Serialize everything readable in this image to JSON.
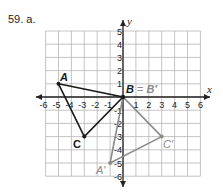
{
  "problem": {
    "label": "59. a."
  },
  "plot": {
    "x_axis_label": "x",
    "y_axis_label": "y",
    "x_ticks": [
      "-6",
      "-5",
      "-4",
      "-3",
      "-2",
      "-1",
      "1",
      "2",
      "3",
      "4",
      "5",
      "6"
    ],
    "y_ticks": [
      "5",
      "4",
      "3",
      "2",
      "1",
      "-1",
      "-2",
      "-3",
      "-4",
      "-5",
      "-6"
    ],
    "xlim": [
      -6,
      6
    ],
    "ylim": [
      -6,
      5
    ]
  },
  "original_triangle": {
    "color": "#1a1a1a",
    "vertices": [
      {
        "name": "A",
        "x": -5,
        "y": 1
      },
      {
        "name": "B",
        "x": 0,
        "y": 0
      },
      {
        "name": "C",
        "x": -3,
        "y": -3
      }
    ]
  },
  "image_triangle": {
    "color": "#8c8c8c",
    "vertices": [
      {
        "name": "A′",
        "x": -1,
        "y": -5
      },
      {
        "name": "B′",
        "x": 0,
        "y": 0
      },
      {
        "name": "C′",
        "x": 3,
        "y": -3
      }
    ]
  },
  "labels": {
    "A": "A",
    "C": "C",
    "B_eq": "B",
    "eq": " = ",
    "B_prime": "B′",
    "A_prime": "A′",
    "C_prime": "C′"
  }
}
